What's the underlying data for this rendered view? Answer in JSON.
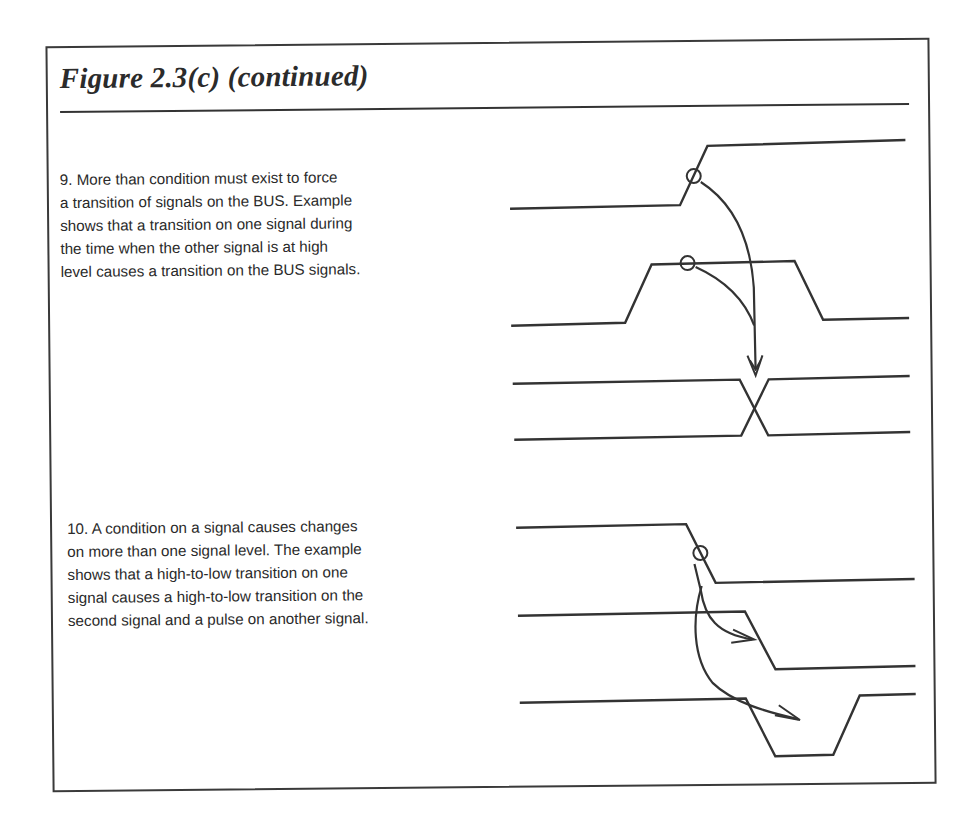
{
  "figure": {
    "title": "Figure 2.3(c) (continued)"
  },
  "sections": [
    {
      "number": "9",
      "lines": [
        "9. More than condition must exist to force",
        "a transition of signals on the BUS. Example",
        "shows that a transition on one signal during",
        "the time when the other signal is at high",
        "level causes a transition on the BUS signals."
      ],
      "diagram": {
        "description": "Timing diagram: a low-to-high transition on signal 1 while signal 2 is high causes a transition (crossover) on the BUS signals",
        "signals": [
          "signal 1 (rising edge)",
          "signal 2 (high pulse)",
          "BUS line A",
          "BUS line B"
        ],
        "markers": [
          "circle-on-rising-edge",
          "circle-on-high-level"
        ],
        "arrows": [
          "curved arrow from signal 1 edge to BUS crossover",
          "curved arrow from signal 2 high level to BUS crossover"
        ]
      }
    },
    {
      "number": "10",
      "lines": [
        "10. A condition on a signal causes changes",
        "on more than one signal level. The example",
        "shows that a high-to-low transition on one",
        "signal causes a high-to-low transition on the",
        "second signal and a pulse on another signal."
      ],
      "diagram": {
        "description": "Timing diagram: a high-to-low transition on signal 1 causes a high-to-low transition on signal 2 and a low pulse on signal 3",
        "signals": [
          "signal 1 (falling edge)",
          "signal 2 (falling edge)",
          "signal 3 (low pulse)"
        ],
        "markers": [
          "circle-on-falling-edge"
        ],
        "arrows": [
          "curved arrow to signal 2 falling edge",
          "curved arrow to signal 3 pulse"
        ]
      }
    }
  ],
  "colors": {
    "ink": "#333333",
    "background": "#ffffff"
  }
}
